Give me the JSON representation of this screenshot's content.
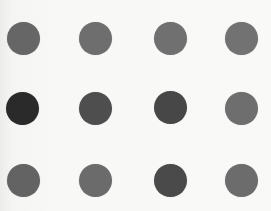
{
  "stimulus": {
    "background": "#f7f7f5",
    "dot_diameter": 33,
    "rows": 3,
    "cols": 4,
    "dots": [
      {
        "row": 0,
        "col": 0,
        "cx": 23,
        "cy": 38,
        "color": "#666666"
      },
      {
        "row": 0,
        "col": 1,
        "cx": 95,
        "cy": 38,
        "color": "#6e6e6e"
      },
      {
        "row": 0,
        "col": 2,
        "cx": 170,
        "cy": 38,
        "color": "#707070"
      },
      {
        "row": 0,
        "col": 3,
        "cx": 241,
        "cy": 38,
        "color": "#727272"
      },
      {
        "row": 1,
        "col": 0,
        "cx": 22,
        "cy": 108,
        "color": "#2a2a2a"
      },
      {
        "row": 1,
        "col": 1,
        "cx": 95,
        "cy": 108,
        "color": "#4e4e4e"
      },
      {
        "row": 1,
        "col": 2,
        "cx": 170,
        "cy": 107,
        "color": "#474747"
      },
      {
        "row": 1,
        "col": 3,
        "cx": 241,
        "cy": 108,
        "color": "#6e6e6e"
      },
      {
        "row": 2,
        "col": 0,
        "cx": 23,
        "cy": 180,
        "color": "#636363"
      },
      {
        "row": 2,
        "col": 1,
        "cx": 95,
        "cy": 180,
        "color": "#6b6b6b"
      },
      {
        "row": 2,
        "col": 2,
        "cx": 170,
        "cy": 180,
        "color": "#4a4a4a"
      },
      {
        "row": 2,
        "col": 3,
        "cx": 241,
        "cy": 180,
        "color": "#6c6c6c"
      }
    ]
  }
}
